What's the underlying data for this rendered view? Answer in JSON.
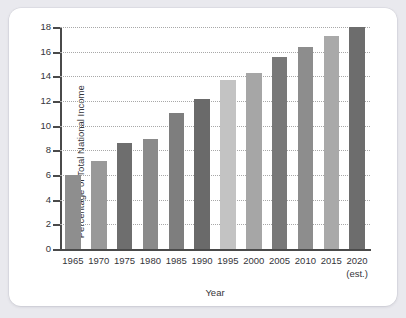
{
  "chart_data": {
    "type": "bar",
    "title": "",
    "xlabel": "Year",
    "ylabel": "Percentage of Total National Income",
    "categories": [
      "1965",
      "1970",
      "1975",
      "1980",
      "1985",
      "1990",
      "1995",
      "2000",
      "2005",
      "2010",
      "2015",
      "2020"
    ],
    "category_sublabels": [
      "",
      "",
      "",
      "",
      "",
      "",
      "",
      "",
      "",
      "",
      "",
      "(est.)"
    ],
    "values": [
      6.0,
      7.1,
      8.6,
      8.9,
      11.0,
      12.2,
      13.7,
      14.3,
      15.6,
      16.4,
      17.3,
      18.2
    ],
    "ylim": [
      0,
      18
    ],
    "yticks": [
      "0",
      "2",
      "4",
      "6",
      "8",
      "10",
      "12",
      "14",
      "16",
      "18"
    ],
    "ytick_values": [
      0,
      2,
      4,
      6,
      8,
      10,
      12,
      14,
      16,
      18
    ],
    "grid": true,
    "grid_style": "dotted",
    "legend": "none",
    "bar_colors": [
      "#8e8e8e",
      "#999999",
      "#6e6e6e",
      "#8a8a8a",
      "#7e7e7e",
      "#6a6a6a",
      "#c3c3c3",
      "#a6a6a6",
      "#787878",
      "#8d8d8d",
      "#a9a9a9",
      "#6d6d6d"
    ]
  },
  "theme": {
    "page_background": "#e9e9ee",
    "card_background": "#ffffff",
    "axis_color": "#4a4a4a",
    "grid_color": "#a8a8a8",
    "text_color": "#35353a"
  }
}
